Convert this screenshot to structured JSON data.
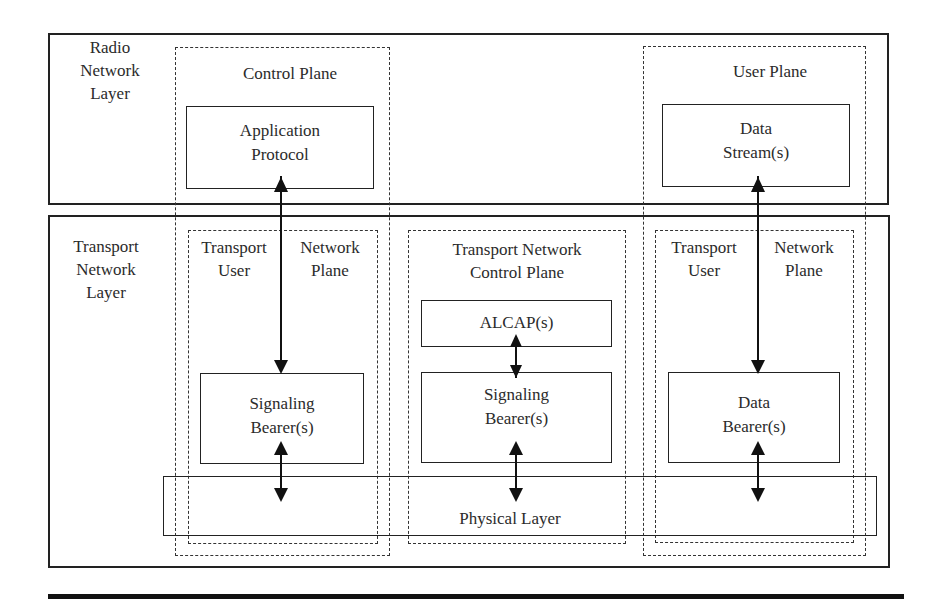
{
  "diagram": {
    "type": "layered protocol architecture",
    "layers": {
      "radio": {
        "label_line1": "Radio",
        "label_line2": "Network",
        "label_line3": "Layer"
      },
      "transport": {
        "label_line1": "Transport",
        "label_line2": "Network",
        "label_line3": "Layer"
      }
    },
    "planes": {
      "control_plane": {
        "label": "Control Plane"
      },
      "user_plane": {
        "label": "User Plane"
      },
      "tunp_left": {
        "col1_line1": "Transport",
        "col1_line2": "User",
        "col2_line1": "Network",
        "col2_line2": "Plane"
      },
      "tncp": {
        "label_line1": "Transport Network",
        "label_line2": "Control Plane"
      },
      "tunp_right": {
        "col1_line1": "Transport",
        "col1_line2": "User",
        "col2_line1": "Network",
        "col2_line2": "Plane"
      }
    },
    "boxes": {
      "application_protocol": {
        "line1": "Application",
        "line2": "Protocol"
      },
      "data_streams": {
        "line1": "Data",
        "line2": "Stream(s)"
      },
      "alcap": {
        "line1": "ALCAP(s)"
      },
      "signaling_bearer_left": {
        "line1": "Signaling",
        "line2": "Bearer(s)"
      },
      "signaling_bearer_mid": {
        "line1": "Signaling",
        "line2": "Bearer(s)"
      },
      "data_bearers": {
        "line1": "Data",
        "line2": "Bearer(s)"
      },
      "physical_layer": {
        "label": "Physical Layer"
      }
    },
    "connections": [
      {
        "from": "Application Protocol",
        "to": "Signaling Bearer(s)",
        "style": "double-arrow"
      },
      {
        "from": "Signaling Bearer(s)",
        "to": "Physical Layer",
        "style": "double-arrow"
      },
      {
        "from": "ALCAP(s)",
        "to": "Signaling Bearer(s)",
        "style": "double-arrow"
      },
      {
        "from": "Signaling Bearer(s)",
        "to": "Physical Layer",
        "style": "double-arrow"
      },
      {
        "from": "Data Stream(s)",
        "to": "Data Bearer(s)",
        "style": "double-arrow"
      },
      {
        "from": "Data Bearer(s)",
        "to": "Physical Layer",
        "style": "double-arrow"
      }
    ],
    "colors": {
      "stroke": "#222222",
      "background": "#ffffff",
      "text": "#2b2b2b"
    }
  }
}
